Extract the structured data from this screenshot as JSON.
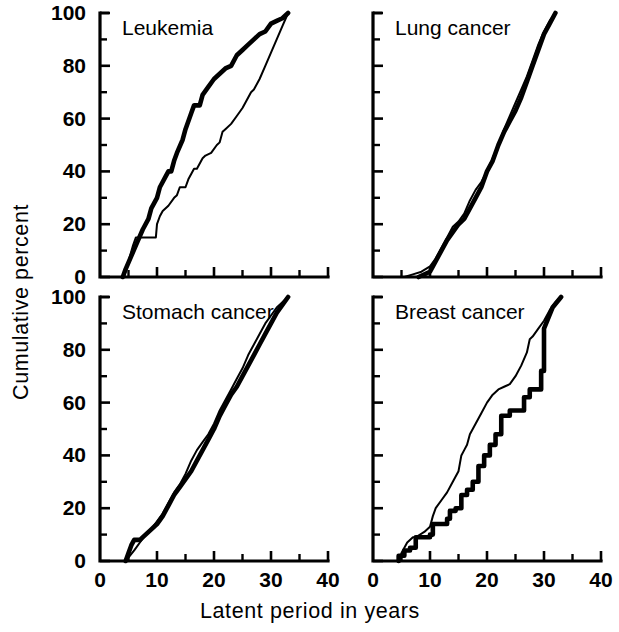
{
  "figure": {
    "xlabel": "Latent period in years",
    "ylabel": "Cumulative percent",
    "x_ticklabels": [
      "0",
      "10",
      "20",
      "30",
      "40"
    ],
    "y_ticklabels": [
      "0",
      "20",
      "40",
      "60",
      "80",
      "100"
    ],
    "line_color": "#000000",
    "background": "#ffffff"
  },
  "chart_data": [
    {
      "type": "line",
      "title": "Leukemia",
      "xlabel": "Latent period in years",
      "ylabel": "Cumulative percent",
      "xlim": [
        0,
        40
      ],
      "ylim": [
        0,
        100
      ],
      "xticks": [
        0,
        5,
        10,
        15,
        20,
        25,
        30,
        35,
        40
      ],
      "xtick_labels": [
        "0",
        "",
        "10",
        "",
        "20",
        "",
        "30",
        "",
        "40"
      ],
      "yticks": [
        0,
        10,
        20,
        30,
        40,
        50,
        60,
        70,
        80,
        90,
        100
      ],
      "ytick_labels": [
        "0",
        "",
        "20",
        "",
        "40",
        "",
        "60",
        "",
        "80",
        "",
        "100"
      ],
      "grid": false,
      "legend": "none",
      "series": [
        {
          "name": "thick-curve",
          "style": "thick",
          "x": [
            4.0,
            4.5,
            5.5,
            6.5,
            7.5,
            8.5,
            9.0,
            9.5,
            10.0,
            10.5,
            11.5,
            12.0,
            12.5,
            13.0,
            13.5,
            14.5,
            15.0,
            16.0,
            16.5,
            17.5,
            18.0,
            19.0,
            20.0,
            21.0,
            22.0,
            23.0,
            24.0,
            25.0,
            26.0,
            27.0,
            28.0,
            29.0,
            30.0,
            31.0,
            32.0,
            33.0
          ],
          "y": [
            0,
            3,
            8,
            13,
            18,
            22,
            26,
            28,
            30,
            34,
            38,
            40,
            40,
            44,
            47,
            52,
            56,
            62,
            65,
            65,
            69,
            72,
            75,
            77,
            79,
            80,
            84,
            86,
            88,
            90,
            92,
            93,
            96,
            97,
            98,
            100
          ]
        },
        {
          "name": "thin-curve",
          "style": "thin",
          "x": [
            4.2,
            5.0,
            5.8,
            6.3,
            9.8,
            10.0,
            10.5,
            11.0,
            12.0,
            13.0,
            13.5,
            14.0,
            15.0,
            15.5,
            16.0,
            16.5,
            17.0,
            18.0,
            18.5,
            19.5,
            20.5,
            21.0,
            21.5,
            22.0,
            23.0,
            24.0,
            25.0,
            26.0,
            26.5,
            27.0,
            28.0,
            29.0,
            30.0,
            31.0,
            32.0,
            33.0
          ],
          "y": [
            0,
            6,
            12,
            15,
            15,
            20,
            23,
            25,
            27,
            30,
            31,
            34,
            34,
            37,
            39,
            41,
            41,
            45,
            46,
            47,
            50,
            51,
            55,
            56,
            58,
            61,
            64,
            68,
            70,
            71,
            75,
            80,
            85,
            90,
            95,
            100
          ]
        }
      ]
    },
    {
      "type": "line",
      "title": "Lung cancer",
      "xlabel": "Latent period in years",
      "ylabel": "Cumulative percent",
      "xlim": [
        0,
        40
      ],
      "ylim": [
        0,
        100
      ],
      "xticks": [
        0,
        5,
        10,
        15,
        20,
        25,
        30,
        35,
        40
      ],
      "yticks": [
        0,
        10,
        20,
        30,
        40,
        50,
        60,
        70,
        80,
        90,
        100
      ],
      "grid": false,
      "legend": "none",
      "series": [
        {
          "name": "thick-curve",
          "style": "thick",
          "x": [
            8.0,
            10.0,
            11.0,
            12.0,
            13.0,
            14.0,
            15.0,
            16.0,
            17.0,
            18.0,
            19.0,
            20.0,
            21.0,
            22.0,
            23.0,
            24.0,
            25.0,
            26.0,
            27.0,
            28.0,
            29.0,
            30.0,
            31.0,
            32.0
          ],
          "y": [
            0,
            2,
            6,
            10,
            14,
            17,
            20,
            22,
            26,
            30,
            34,
            40,
            44,
            50,
            55,
            59,
            63,
            68,
            74,
            80,
            86,
            92,
            96,
            100
          ]
        },
        {
          "name": "thin-curve",
          "style": "thin",
          "x": [
            5.5,
            7.0,
            8.5,
            10.0,
            11.0,
            12.0,
            13.0,
            14.0,
            15.0,
            16.0,
            17.0,
            18.0,
            19.0,
            20.0,
            21.0,
            22.0,
            23.0,
            24.0,
            25.0,
            26.0,
            27.0,
            28.0,
            29.0,
            30.0,
            31.0,
            32.0
          ],
          "y": [
            0,
            1,
            2,
            4,
            7,
            11,
            15,
            19,
            21,
            24,
            29,
            33,
            36,
            40,
            45,
            50,
            56,
            61,
            66,
            71,
            76,
            82,
            88,
            93,
            97,
            100
          ]
        }
      ]
    },
    {
      "type": "line",
      "title": "Stomach cancer",
      "xlabel": "Latent period in years",
      "ylabel": "Cumulative percent",
      "xlim": [
        0,
        40
      ],
      "ylim": [
        0,
        100
      ],
      "xticks": [
        0,
        5,
        10,
        15,
        20,
        25,
        30,
        35,
        40
      ],
      "yticks": [
        0,
        10,
        20,
        30,
        40,
        50,
        60,
        70,
        80,
        90,
        100
      ],
      "grid": false,
      "legend": "none",
      "series": [
        {
          "name": "thick-curve",
          "style": "thick",
          "x": [
            4.5,
            5.0,
            5.5,
            6.0,
            7.0,
            8.0,
            9.0,
            10.0,
            11.0,
            12.0,
            13.0,
            14.0,
            15.0,
            16.0,
            17.0,
            18.0,
            19.0,
            20.0,
            21.0,
            22.0,
            23.0,
            24.0,
            25.0,
            26.0,
            27.0,
            28.0,
            29.0,
            30.0,
            31.0,
            32.0,
            33.0
          ],
          "y": [
            0,
            3,
            6,
            8,
            8,
            10,
            12,
            14,
            17,
            21,
            25,
            28,
            31,
            34,
            38,
            42,
            46,
            50,
            55,
            59,
            63,
            66,
            70,
            74,
            78,
            82,
            86,
            90,
            94,
            97,
            100
          ]
        },
        {
          "name": "thin-curve",
          "style": "thin",
          "x": [
            4.5,
            6.0,
            7.0,
            8.0,
            9.0,
            10.0,
            11.0,
            12.0,
            13.0,
            14.0,
            15.0,
            16.0,
            17.0,
            18.0,
            19.0,
            20.0,
            21.0,
            22.0,
            23.0,
            24.0,
            25.0,
            26.0,
            27.0,
            28.0,
            29.0,
            30.0,
            31.0,
            32.0,
            33.0
          ],
          "y": [
            0,
            4,
            7,
            10,
            12,
            15,
            18,
            22,
            26,
            29,
            33,
            38,
            42,
            45,
            48,
            52,
            57,
            61,
            65,
            69,
            73,
            78,
            82,
            86,
            90,
            93,
            96,
            98,
            100
          ]
        }
      ]
    },
    {
      "type": "line",
      "title": "Breast cancer",
      "xlabel": "Latent period in years",
      "ylabel": "Cumulative percent",
      "xlim": [
        0,
        40
      ],
      "ylim": [
        0,
        100
      ],
      "xticks": [
        0,
        5,
        10,
        15,
        20,
        25,
        30,
        35,
        40
      ],
      "yticks": [
        0,
        10,
        20,
        30,
        40,
        50,
        60,
        70,
        80,
        90,
        100
      ],
      "grid": false,
      "legend": "none",
      "series": [
        {
          "name": "thick-curve",
          "style": "thick",
          "x": [
            4.5,
            4.5,
            5.5,
            5.5,
            6.5,
            6.5,
            7.5,
            7.5,
            10.0,
            10.0,
            10.5,
            10.5,
            13.0,
            13.0,
            13.5,
            13.5,
            14.5,
            14.5,
            15.5,
            15.5,
            16.5,
            16.5,
            17.5,
            17.5,
            18.5,
            18.5,
            19.5,
            19.5,
            20.5,
            20.5,
            21.5,
            21.5,
            22.5,
            22.5,
            24.0,
            24.0,
            26.5,
            26.5,
            27.5,
            27.5,
            29.5,
            29.5,
            30.0,
            30.0,
            31.5,
            33.0
          ],
          "y": [
            0,
            2,
            2,
            4,
            4,
            5,
            5,
            9,
            9,
            10,
            10,
            14,
            14,
            16,
            16,
            19,
            19,
            20,
            20,
            25,
            25,
            27,
            27,
            30,
            30,
            36,
            36,
            40,
            40,
            44,
            44,
            48,
            48,
            55,
            55,
            57,
            57,
            62,
            62,
            65,
            65,
            72,
            72,
            88,
            96,
            100
          ]
        },
        {
          "name": "thin-curve",
          "style": "thin",
          "x": [
            4.5,
            5.0,
            6.0,
            7.0,
            7.5,
            9.0,
            10.0,
            10.5,
            11.0,
            12.0,
            13.0,
            14.0,
            15.0,
            15.5,
            16.0,
            16.5,
            17.0,
            18.0,
            19.0,
            20.0,
            21.0,
            22.0,
            23.0,
            24.0,
            25.0,
            26.0,
            27.0,
            27.5,
            28.0,
            29.0,
            30.0,
            31.0,
            32.0,
            33.0
          ],
          "y": [
            0,
            3,
            7,
            9,
            9,
            11,
            13,
            17,
            20,
            23,
            26,
            30,
            34,
            40,
            42,
            44,
            48,
            52,
            56,
            60,
            63,
            65,
            66,
            67,
            70,
            74,
            79,
            84,
            85,
            88,
            91,
            95,
            98,
            100
          ]
        }
      ]
    }
  ]
}
